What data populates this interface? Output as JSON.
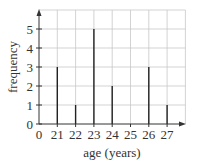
{
  "chart_data": {
    "type": "bar",
    "style": "vertical-line (stick) chart",
    "title": "",
    "xlabel": "age (years)",
    "ylabel": "frequency",
    "categories": [
      "21",
      "22",
      "23",
      "24",
      "25",
      "26",
      "27"
    ],
    "values": [
      3,
      1,
      5,
      2,
      0,
      3,
      1
    ],
    "x_tick_labels": [
      "0",
      "21",
      "22",
      "23",
      "24",
      "25",
      "26",
      "27"
    ],
    "y_tick_labels": [
      "0",
      "1",
      "2",
      "3",
      "4",
      "5"
    ],
    "ylim": [
      0,
      5.8
    ],
    "x_axis_break": "0 then 21..27",
    "grid": true,
    "legend": null,
    "colors": {
      "sticks": "#222222",
      "grid": "#c8c8c8",
      "axis": "#333333"
    }
  }
}
